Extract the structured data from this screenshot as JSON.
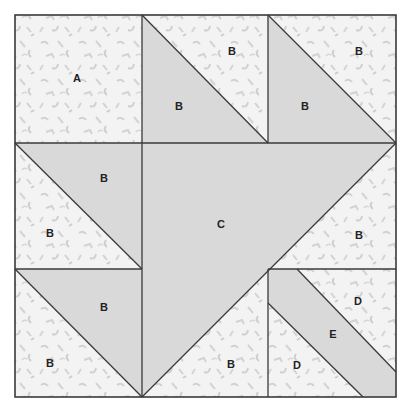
{
  "diagram": {
    "type": "quilt-block-pattern",
    "colors": {
      "background": "#f3f3f3",
      "print_speck": "#d2d2d2",
      "solid": "#d9d9d9",
      "line": "#3a3a3a",
      "text": "#222222"
    },
    "labels": {
      "a1": "A",
      "b1": "B",
      "b2": "B",
      "b3": "B",
      "b4": "B",
      "b5": "B",
      "b6": "B",
      "b7": "B",
      "b8": "B",
      "b9": "B",
      "b10": "B",
      "c1": "C",
      "d1": "D",
      "d2": "D",
      "e1": "E"
    }
  }
}
